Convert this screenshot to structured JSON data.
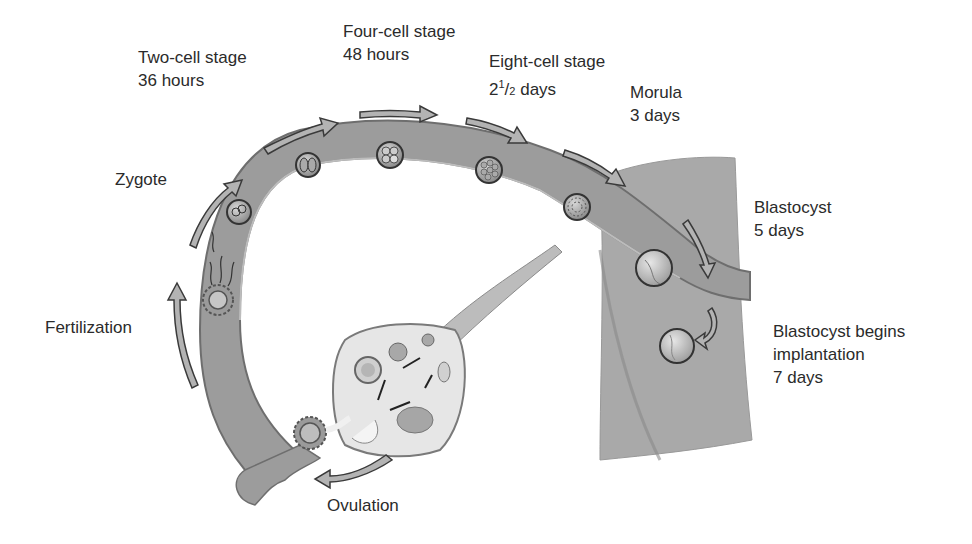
{
  "diagram": {
    "colors": {
      "background": "#ffffff",
      "tube_fill": "#9a9a9a",
      "tube_edge": "#6e6e6e",
      "uterus_fill": "#a8a8a8",
      "ovary_fill": "#e4e4e4",
      "arrow_fill": "#b0b0b0",
      "arrow_stroke": "#3a3a3a",
      "text": "#2b2b2b"
    },
    "stages": [
      {
        "id": "ovulation",
        "name": "Ovulation",
        "time": ""
      },
      {
        "id": "fertilization",
        "name": "Fertilization",
        "time": ""
      },
      {
        "id": "zygote",
        "name": "Zygote",
        "time": ""
      },
      {
        "id": "two-cell",
        "name": "Two-cell stage",
        "time": "36 hours"
      },
      {
        "id": "four-cell",
        "name": "Four-cell stage",
        "time": "48 hours"
      },
      {
        "id": "eight-cell",
        "name": "Eight-cell stage",
        "time_whole": "2",
        "time_num": "1",
        "time_den": "2",
        "time_unit": "days"
      },
      {
        "id": "morula",
        "name": "Morula",
        "time": "3 days"
      },
      {
        "id": "blastocyst",
        "name": "Blastocyst",
        "time": "5 days"
      },
      {
        "id": "implantation",
        "name": "Blastocyst begins",
        "name2": "implantation",
        "time": "7 days"
      }
    ]
  }
}
